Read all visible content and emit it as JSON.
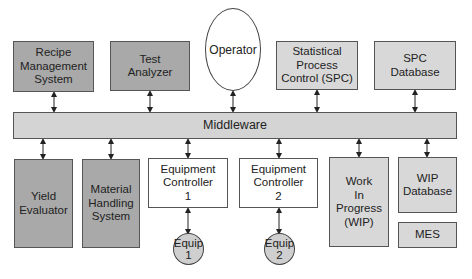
{
  "diagram": {
    "top_row": [
      {
        "id": "recipe",
        "label": "Recipe\nManagement\nSystem",
        "fill": "#a9a9a9"
      },
      {
        "id": "test",
        "label": "Test\nAnalyzer",
        "fill": "#a9a9a9"
      },
      {
        "id": "operator",
        "label": "Operator",
        "shape": "ellipse"
      },
      {
        "id": "spc",
        "label": "Statistical\nProcess\nControl (SPC)",
        "fill": "#d8d8d8"
      },
      {
        "id": "spcdb",
        "label": "SPC\nDatabase",
        "fill": "#d8d8d8"
      }
    ],
    "middleware": {
      "label": "Middleware",
      "fill": "#d4d4d4"
    },
    "bottom_row": [
      {
        "id": "yield",
        "label": "Yield\nEvaluator",
        "fill": "#a9a9a9"
      },
      {
        "id": "mhs",
        "label": "Material\nHandling\nSystem",
        "fill": "#a9a9a9"
      },
      {
        "id": "ec1",
        "label": "Equipment\nController\n1",
        "fill": "#ffffff"
      },
      {
        "id": "ec2",
        "label": "Equipment\nController\n2",
        "fill": "#ffffff"
      },
      {
        "id": "wip",
        "label": "Work\nIn\nProgress\n(WIP)",
        "fill": "#d8d8d8"
      },
      {
        "id": "wipdb",
        "label": "WIP\nDatabase",
        "fill": "#d8d8d8"
      },
      {
        "id": "mes",
        "label": "MES",
        "fill": "#d8d8d8"
      }
    ],
    "equipment": [
      {
        "id": "equip1",
        "label": "Equip\n1",
        "fill": "#cfcfcf"
      },
      {
        "id": "equip2",
        "label": "Equip\n2",
        "fill": "#cfcfcf"
      }
    ],
    "connections": [
      [
        "recipe",
        "middleware"
      ],
      [
        "test",
        "middleware"
      ],
      [
        "operator",
        "middleware"
      ],
      [
        "spc",
        "middleware"
      ],
      [
        "spcdb",
        "middleware"
      ],
      [
        "middleware",
        "yield"
      ],
      [
        "middleware",
        "mhs"
      ],
      [
        "middleware",
        "ec1"
      ],
      [
        "middleware",
        "ec2"
      ],
      [
        "middleware",
        "wip"
      ],
      [
        "middleware",
        "wipdb"
      ],
      [
        "ec1",
        "equip1"
      ],
      [
        "ec2",
        "equip2"
      ]
    ]
  }
}
